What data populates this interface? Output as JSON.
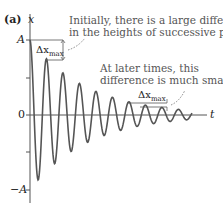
{
  "panel_label": "(a)",
  "axes": {
    "y_label": "x",
    "x_label": "t",
    "ticks": {
      "top": "A",
      "zero": "0",
      "bottom": "−A"
    }
  },
  "annotations": {
    "early": {
      "line1": "Initially, there is a large difference",
      "line2": "in the heights of successive peaks.",
      "delta_label": "Δx",
      "delta_sub": "max"
    },
    "late": {
      "line1": "At later times, this",
      "line2": "difference is much smaller.",
      "delta_label": "Δx",
      "delta_sub": "max"
    }
  },
  "colors": {
    "curve": "#555555",
    "axis": "#555555",
    "text": "#555555"
  }
}
